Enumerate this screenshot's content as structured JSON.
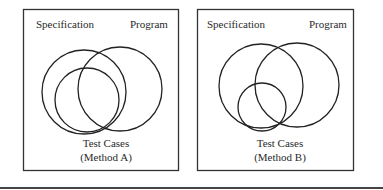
{
  "panels": [
    {
      "id": "method-a",
      "spec_label": "Specification",
      "program_label": "Program",
      "test_label": "Test Cases",
      "method_label": "(Method A)"
    },
    {
      "id": "method-b",
      "spec_label": "Specification",
      "program_label": "Program",
      "test_label": "Test Cases",
      "method_label": "(Method B)"
    }
  ],
  "colors": {
    "stroke": "#222222",
    "background": "#ffffff"
  }
}
